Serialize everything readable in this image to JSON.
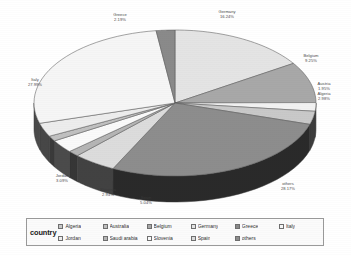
{
  "chart_data": {
    "type": "pie",
    "title": "",
    "legend_title": "country",
    "legend_position": "bottom",
    "three_d": true,
    "categories": [
      "Algeria",
      "Australia",
      "Belgium",
      "Germany",
      "Greece",
      "Italy",
      "Jordan",
      "Saudi arabia",
      "Slovenia",
      "Spain",
      "others"
    ],
    "labels": [
      {
        "name": "Germany",
        "percent": "16.24%",
        "value": 16.24
      },
      {
        "name": "Belgium",
        "percent": "9.25%",
        "value": 9.25
      },
      {
        "name": "Austria",
        "percent": "1.95%",
        "value": 1.95
      },
      {
        "name": "Algeria",
        "percent": "2.98%",
        "value": 2.98
      },
      {
        "name": "others",
        "percent": "28.17%",
        "value": 28.17
      },
      {
        "name": "Spain",
        "percent": "5.04%",
        "value": 5.04
      },
      {
        "name": "Slovenia",
        "percent": "2.94%",
        "value": 2.94
      },
      {
        "name": "Jordan",
        "percent": "3.09%",
        "value": 3.09
      },
      {
        "name": "Italy",
        "percent": "27.99%",
        "value": 27.99
      },
      {
        "name": "Greece",
        "percent": "2.19%",
        "value": 2.19
      }
    ],
    "slices": [
      {
        "name": "Germany",
        "value": 16.24,
        "color": "#e4e4e4"
      },
      {
        "name": "Belgium",
        "value": 9.25,
        "color": "#a8a8a8"
      },
      {
        "name": "Austria",
        "value": 1.95,
        "color": "#f2f2f2"
      },
      {
        "name": "Algeria",
        "value": 2.98,
        "color": "#c9c9c9"
      },
      {
        "name": "others",
        "value": 28.17,
        "color": "#8d8d8d"
      },
      {
        "name": "Spain",
        "value": 5.04,
        "color": "#dcdcdc"
      },
      {
        "name": "Saudi arabia",
        "value": 1.3,
        "color": "#b5b5b5"
      },
      {
        "name": "Slovenia",
        "value": 2.94,
        "color": "#fafafa"
      },
      {
        "name": "Australia",
        "value": 1.2,
        "color": "#c0c0c0"
      },
      {
        "name": "Jordan",
        "value": 3.09,
        "color": "#ededed"
      },
      {
        "name": "Italy",
        "value": 27.99,
        "color": "#f6f6f6"
      },
      {
        "name": "Greece",
        "value": 2.19,
        "color": "#8a8a8a"
      }
    ]
  },
  "legend": {
    "title": "country",
    "items": [
      {
        "label": "Algeria",
        "color": "#c9c9c9"
      },
      {
        "label": "Australia",
        "color": "#c0c0c0"
      },
      {
        "label": "Belgium",
        "color": "#a8a8a8"
      },
      {
        "label": "Germany",
        "color": "#e4e4e4"
      },
      {
        "label": "Greece",
        "color": "#8a8a8a"
      },
      {
        "label": "Italy",
        "color": "#f6f6f6"
      },
      {
        "label": "Jordan",
        "color": "#ededed"
      },
      {
        "label": "Saudi arabia",
        "color": "#b5b5b5"
      },
      {
        "label": "Slovenia",
        "color": "#fafafa"
      },
      {
        "label": "Spain",
        "color": "#dcdcdc"
      },
      {
        "label": "others",
        "color": "#8d8d8d"
      }
    ]
  },
  "colors": {
    "background": "#ffffff",
    "outline": "#5a5a5a",
    "side_wall_dark": "#2b2b2b",
    "side_wall_mid": "#585858",
    "legend_border": "#9a9a9a",
    "text": "#3a3a3a"
  }
}
